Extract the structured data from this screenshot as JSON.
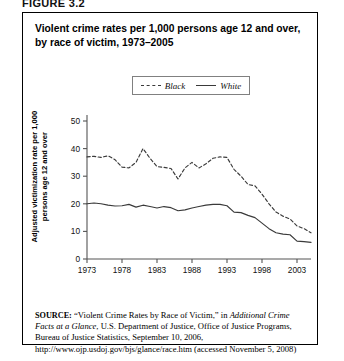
{
  "figure": {
    "label": "FIGURE 3.2"
  },
  "chart_title": "Violent crime rates per 1,000 persons age 12 and over, by race of victim, 1973–2005",
  "legend": {
    "items": [
      {
        "label": "Black",
        "style": "dashed"
      },
      {
        "label": "White",
        "style": "solid"
      }
    ]
  },
  "axes": {
    "ylabel": "Adjusted victimization rate per 1,000 persons age 12 and over",
    "xlabel": "",
    "yticks": [
      "0",
      "10",
      "20",
      "30",
      "40",
      "50"
    ],
    "xticks": [
      "1973",
      "1978",
      "1983",
      "1988",
      "1993",
      "1998",
      "2003"
    ]
  },
  "source": {
    "prefix": "SOURCE:",
    "part1": " “Violent Crime Rates by Race of Victim,” in ",
    "italic1": "Additional Crime Facts at a Glance",
    "part2": ", U.S. Department of Justice, Office of Justice Programs, Bureau of Justice Statistics, September 10, 2006, http://www.ojp.usdoj.gov/bjs/glance/race.htm (accessed November 5, 2008)"
  },
  "colors": {
    "line": "#3a3a3a",
    "axis": "#555555",
    "frame": "#000000",
    "background": "#ffffff"
  },
  "chart_data": {
    "type": "line",
    "title": "Violent crime rates per 1,000 persons age 12 and over, by race of victim, 1973–2005",
    "xlabel": "",
    "ylabel": "Adjusted victimization rate per 1,000 persons age 12 and over",
    "xlim": [
      1973,
      2005
    ],
    "ylim": [
      0,
      50
    ],
    "grid": false,
    "legend_position": "top-center",
    "x": [
      1973,
      1974,
      1975,
      1976,
      1977,
      1978,
      1979,
      1980,
      1981,
      1982,
      1983,
      1984,
      1985,
      1986,
      1987,
      1988,
      1989,
      1990,
      1991,
      1992,
      1993,
      1994,
      1995,
      1996,
      1997,
      1998,
      1999,
      2000,
      2001,
      2002,
      2003,
      2004,
      2005
    ],
    "series": [
      {
        "name": "Black",
        "style": "dashed",
        "values": [
          37.0,
          37.2,
          36.8,
          37.4,
          36.0,
          33.3,
          33.0,
          35.0,
          40.0,
          36.5,
          33.5,
          33.2,
          32.8,
          29.0,
          33.0,
          35.0,
          33.0,
          34.5,
          36.5,
          37.0,
          36.8,
          32.5,
          30.0,
          27.0,
          26.5,
          23.5,
          20.0,
          17.0,
          15.5,
          14.5,
          12.0,
          11.0,
          9.5
        ]
      },
      {
        "name": "White",
        "style": "solid",
        "values": [
          20.0,
          20.3,
          20.0,
          19.5,
          19.2,
          19.3,
          19.8,
          18.8,
          19.5,
          19.0,
          18.5,
          19.0,
          18.6,
          17.5,
          17.8,
          18.5,
          19.0,
          19.5,
          19.8,
          19.8,
          19.3,
          17.0,
          16.8,
          15.8,
          15.0,
          13.0,
          11.0,
          9.5,
          9.0,
          8.8,
          6.5,
          6.3,
          6.0
        ]
      }
    ]
  }
}
